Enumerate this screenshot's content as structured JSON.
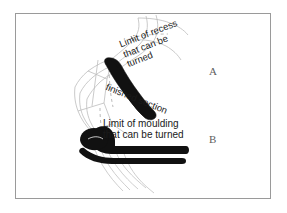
{
  "figure": {
    "background_color": "#ffffff",
    "border_color": "#9a9a9a",
    "ink_color": "#1a1a1a",
    "solid_fill_color": "#111111",
    "outline_color": "#b8b8b8"
  },
  "reference_labels": [
    {
      "id": "a",
      "text": "A"
    },
    {
      "id": "b",
      "text": "B"
    }
  ],
  "annotations": {
    "recess": {
      "line1": "Limit of recess",
      "line2": "that can be",
      "line3": "turned",
      "rotation_deg": -21
    },
    "finished": {
      "line1": "finished section",
      "rotation_deg": 22
    },
    "moulding": {
      "line1": "Limit of moulding",
      "line2": "that can be turned",
      "rotation_deg": 0
    }
  }
}
